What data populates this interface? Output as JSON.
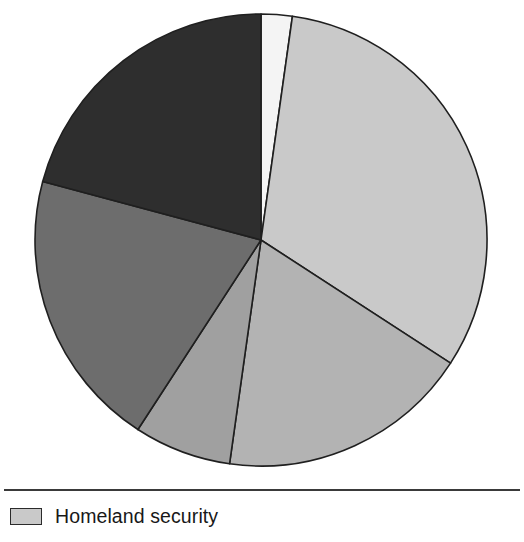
{
  "chart_data": {
    "type": "pie",
    "title": "",
    "xlabel": "",
    "ylabel": "",
    "legend_position": "bottom-left",
    "grid": false,
    "center_x": 261,
    "center_y": 240,
    "radius": 226,
    "start_angle_deg": 0,
    "direction": "clockwise",
    "outline_color": "#1f1f1f",
    "outline_width": 1.6,
    "slices": [
      {
        "label": "",
        "value": 2.2,
        "start_deg": 0,
        "end_deg": 8,
        "color": "#f4f4f4",
        "in_legend": false
      },
      {
        "label": "Homeland security",
        "value": 32.0,
        "start_deg": 8,
        "end_deg": 123,
        "color": "#c9c9c9",
        "in_legend": true
      },
      {
        "label": "",
        "value": 18.0,
        "start_deg": 123,
        "end_deg": 188,
        "color": "#b3b3b3",
        "in_legend": false
      },
      {
        "label": "",
        "value": 7.0,
        "start_deg": 188,
        "end_deg": 213,
        "color": "#a0a0a0",
        "in_legend": false
      },
      {
        "label": "",
        "value": 20.0,
        "start_deg": 213,
        "end_deg": 285,
        "color": "#6d6d6d",
        "in_legend": false
      },
      {
        "label": "",
        "value": 20.8,
        "start_deg": 285,
        "end_deg": 360,
        "color": "#2e2e2e",
        "in_legend": false
      }
    ]
  },
  "legend": {
    "divider_color": "#3a3a3a",
    "entries": [
      {
        "label": "Homeland security",
        "swatch_color": "#c9c9c9",
        "swatch_border": "#2b2b2b"
      }
    ]
  }
}
